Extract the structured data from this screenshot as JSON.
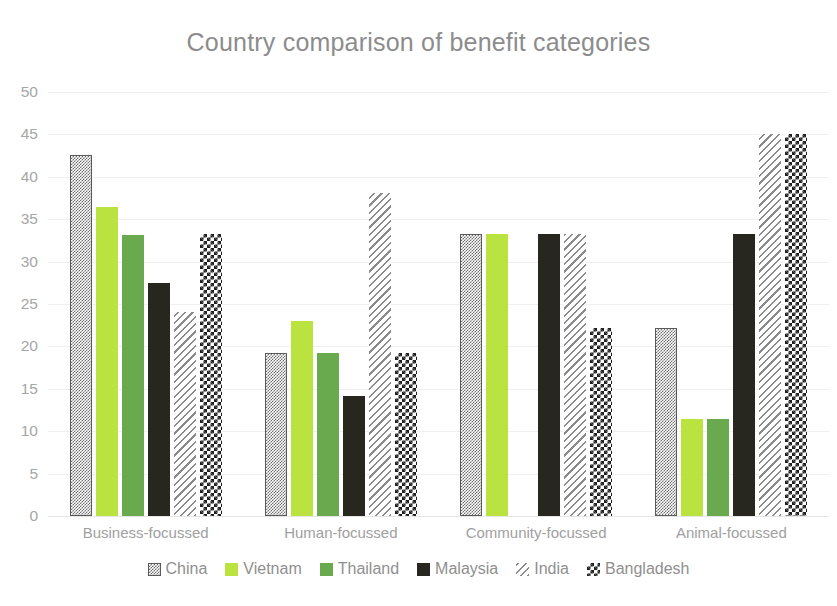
{
  "chart_data": {
    "type": "bar",
    "title": "Country comparison of benefit categories",
    "xlabel": "",
    "ylabel": "",
    "ylim": [
      0,
      50
    ],
    "ytick_step": 5,
    "yticks": [
      50,
      45,
      40,
      35,
      30,
      25,
      20,
      15,
      10,
      5,
      0
    ],
    "grid": true,
    "legend_position": "bottom",
    "categories": [
      "Business-focussed",
      "Human-focussed",
      "Community-focussed",
      "Animal-focussed"
    ],
    "series": [
      {
        "name": "China",
        "values": [
          42.6,
          19.2,
          33.3,
          22.2
        ],
        "color": "#6e6e6e",
        "pattern": "fine-checker-gray"
      },
      {
        "name": "Vietnam",
        "values": [
          36.4,
          23.0,
          33.3,
          11.4
        ],
        "color": "#bbe33f",
        "pattern": "solid"
      },
      {
        "name": "Thailand",
        "values": [
          33.1,
          19.2,
          0,
          11.4
        ],
        "color": "#6aaa4f",
        "pattern": "solid"
      },
      {
        "name": "Malaysia",
        "values": [
          27.5,
          14.1,
          33.3,
          33.3
        ],
        "color": "#272720",
        "pattern": "solid"
      },
      {
        "name": "India",
        "values": [
          24.0,
          38.1,
          33.3,
          45.0
        ],
        "color": "#8a8a8a",
        "pattern": "diagonal-stripe"
      },
      {
        "name": "Bangladesh",
        "values": [
          33.3,
          19.2,
          22.2,
          45.0
        ],
        "color": "#1f1f1f",
        "pattern": "checkerboard"
      }
    ]
  },
  "legend": {
    "items": [
      {
        "label": "China",
        "icon": "checker-swatch-icon"
      },
      {
        "label": "Vietnam",
        "icon": "solid-swatch-icon"
      },
      {
        "label": "Thailand",
        "icon": "solid-swatch-icon"
      },
      {
        "label": "Malaysia",
        "icon": "solid-swatch-icon"
      },
      {
        "label": "India",
        "icon": "stripe-swatch-icon"
      },
      {
        "label": "Bangladesh",
        "icon": "checker-swatch-icon"
      }
    ]
  }
}
